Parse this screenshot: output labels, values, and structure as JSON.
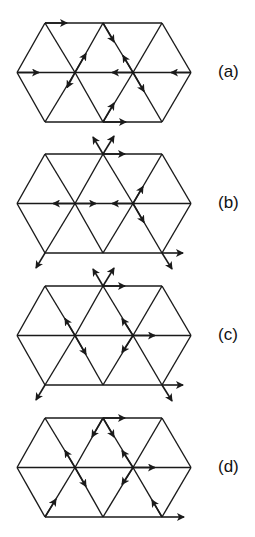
{
  "panels": [
    {
      "label": "(a)",
      "top": 23
    },
    {
      "label": "(b)",
      "top": 154
    },
    {
      "label": "(c)",
      "top": 286
    },
    {
      "label": "(d)",
      "top": 418
    }
  ],
  "colors": {
    "line": "#1a1a1a",
    "background": "#ffffff"
  }
}
